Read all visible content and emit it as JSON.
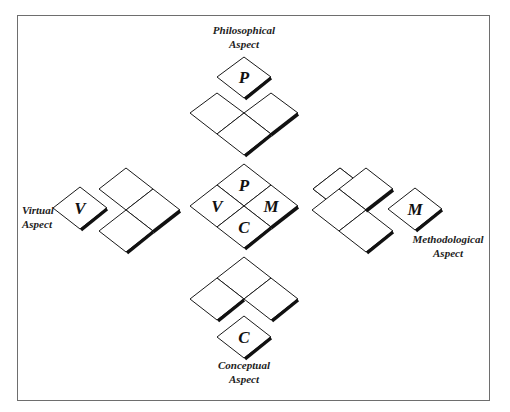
{
  "diagram": {
    "border_color": "#6e6e6e",
    "tile_fill": "#ffffff",
    "tile_stroke": "#1a1a1a",
    "shadow_color": "#111111",
    "center_group": {
      "labels": {
        "top": "P",
        "left": "V",
        "right": "M",
        "bottom": "C"
      }
    },
    "aspects": [
      {
        "id": "philosophical",
        "letter": "P",
        "caption_line1": "Philosophical",
        "caption_line2": "Aspect",
        "position": "top"
      },
      {
        "id": "virtual",
        "letter": "V",
        "caption_line1": "Virtual",
        "caption_line2": "Aspect",
        "position": "left"
      },
      {
        "id": "methodological",
        "letter": "M",
        "caption_line1": "Methodological",
        "caption_line2": "Aspect",
        "position": "right"
      },
      {
        "id": "conceptual",
        "letter": "C",
        "caption_line1": "Conceptual",
        "caption_line2": "Aspect",
        "position": "bottom"
      }
    ]
  }
}
